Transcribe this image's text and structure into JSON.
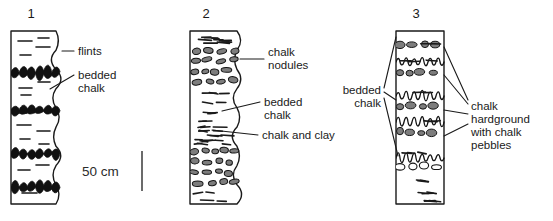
{
  "figure": {
    "background": "#ffffff",
    "ink": "#1a1a1a",
    "nodule_fill": "#7d7d7d",
    "flint_fill": "#111111"
  },
  "scale": {
    "label": "50 cm",
    "x": 82,
    "y": 176,
    "bar_x": 142,
    "bar_y1": 151,
    "bar_y2": 191
  },
  "columns": [
    {
      "id": "column-1",
      "number": "1",
      "number_x": 31,
      "number_y": 18,
      "box": {
        "x": 11,
        "y": 31,
        "w": 45,
        "h": 173
      },
      "right_edge": "wavy",
      "beds": [
        {
          "x": 18,
          "y": 41,
          "w": 14
        },
        {
          "x": 36,
          "y": 47,
          "w": 14
        },
        {
          "x": 20,
          "y": 55,
          "w": 11
        },
        {
          "x": 38,
          "y": 38,
          "w": 11
        },
        {
          "x": 19,
          "y": 88,
          "w": 13
        },
        {
          "x": 38,
          "y": 82,
          "w": 12
        },
        {
          "x": 21,
          "y": 95,
          "w": 10
        },
        {
          "x": 17,
          "y": 125,
          "w": 14
        },
        {
          "x": 37,
          "y": 131,
          "w": 13
        },
        {
          "x": 20,
          "y": 139,
          "w": 10
        },
        {
          "x": 39,
          "y": 144,
          "w": 10
        },
        {
          "x": 18,
          "y": 170,
          "w": 12
        },
        {
          "x": 36,
          "y": 165,
          "w": 13
        },
        {
          "x": 22,
          "y": 193,
          "w": 15
        },
        {
          "x": 18,
          "y": 113,
          "w": 9
        }
      ],
      "flint_bands": [
        {
          "y": 66,
          "h": 13
        },
        {
          "y": 105,
          "h": 10
        },
        {
          "y": 148,
          "h": 11
        },
        {
          "y": 181,
          "h": 12
        }
      ]
    },
    {
      "id": "column-2",
      "number": "2",
      "number_x": 206,
      "number_y": 18,
      "box": {
        "x": 190,
        "y": 31,
        "w": 47,
        "h": 173
      },
      "right_edge": "wavy",
      "nodule_zones": [
        {
          "y": 45,
          "h": 39
        },
        {
          "y": 146,
          "h": 40
        }
      ],
      "clay_zone": {
        "y": 117,
        "h": 24
      },
      "bedded_zone": {
        "y": 88,
        "h": 26
      }
    },
    {
      "id": "column-3",
      "number": "3",
      "number_x": 416,
      "number_y": 18,
      "box": {
        "x": 396,
        "y": 31,
        "w": 48,
        "h": 173
      },
      "right_edge": "straight",
      "hardgrounds": [
        {
          "y": 45,
          "type": "pebble"
        },
        {
          "y": 62,
          "type": "wavy"
        },
        {
          "y": 72,
          "type": "pebble"
        },
        {
          "y": 96,
          "type": "wavy"
        },
        {
          "y": 106,
          "type": "pebble"
        },
        {
          "y": 122,
          "type": "wavy"
        },
        {
          "y": 132,
          "type": "pebble"
        },
        {
          "y": 158,
          "type": "wavy"
        },
        {
          "y": 166,
          "type": "open-pebble"
        }
      ]
    }
  ],
  "labels": [
    {
      "id": "label-flints",
      "lines": [
        "flints"
      ],
      "x": 78,
      "y": 55,
      "anchor": "start",
      "leaders": [
        [
          62,
          51,
          74,
          51
        ]
      ]
    },
    {
      "id": "label-bedded-chalk-1",
      "lines": [
        "bedded",
        "chalk"
      ],
      "x": 78,
      "y": 79,
      "anchor": "start",
      "leaders": [
        [
          50,
          89,
          74,
          75
        ]
      ]
    },
    {
      "id": "label-chalk-nodules",
      "lines": [
        "chalk",
        "nodules"
      ],
      "x": 268,
      "y": 56,
      "anchor": "start",
      "leaders": [
        [
          240,
          59,
          264,
          59
        ]
      ]
    },
    {
      "id": "label-bedded-chalk-2",
      "lines": [
        "bedded",
        "chalk"
      ],
      "x": 264,
      "y": 106,
      "anchor": "start",
      "leaders": [
        [
          222,
          111,
          260,
          102
        ]
      ]
    },
    {
      "id": "label-chalk-and-clay",
      "lines": [
        "chalk and clay"
      ],
      "x": 262,
      "y": 139,
      "anchor": "start",
      "leaders": [
        [
          212,
          130,
          258,
          135
        ]
      ]
    },
    {
      "id": "label-bedded-chalk-3",
      "lines": [
        "bedded",
        "chalk"
      ],
      "x": 381,
      "y": 94,
      "anchor": "end",
      "leaders": [
        [
          384,
          88,
          396,
          37
        ],
        [
          384,
          92,
          396,
          100
        ],
        [
          384,
          98,
          398,
          156
        ]
      ]
    },
    {
      "id": "label-chalk-hardground",
      "lines": [
        "chalk",
        "hardground",
        "with chalk",
        "pebbles"
      ],
      "x": 471,
      "y": 110,
      "anchor": "start",
      "leaders": [
        [
          444,
          47,
          468,
          100
        ],
        [
          444,
          75,
          468,
          104
        ],
        [
          444,
          110,
          468,
          114
        ],
        [
          444,
          136,
          468,
          124
        ]
      ]
    }
  ]
}
